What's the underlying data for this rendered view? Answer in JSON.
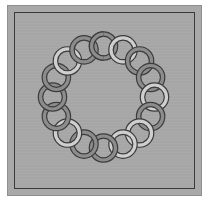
{
  "artwork": {
    "title": "",
    "pattern": "interlocking-ring-wreath",
    "colors": {
      "background": "#ffffff",
      "panel": "#a9a9a9",
      "border_line": "#3a3a3a",
      "ring_outline": "#3c3c3c",
      "ring_light": "#cfcfcf",
      "ring_dark": "#8c8c8c"
    },
    "wreath": {
      "center_x": 103.5,
      "center_y": 97,
      "radius": 51,
      "ring_outer_radius": 14,
      "ring_inner_radius": 10,
      "ring_count": 16,
      "ring_shades": [
        "dark",
        "light",
        "dark",
        "dark",
        "light",
        "dark",
        "light",
        "light",
        "dark",
        "dark",
        "light",
        "dark",
        "dark",
        "dark",
        "light",
        "dark"
      ]
    }
  }
}
